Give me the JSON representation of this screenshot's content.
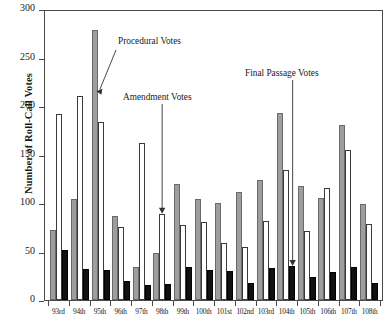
{
  "chart_data": {
    "type": "bar",
    "title": "",
    "xlabel": "",
    "ylabel": "Number of Roll-Call Votes",
    "ylim": [
      0,
      300
    ],
    "yticks": [
      0,
      50,
      100,
      150,
      200,
      250,
      300
    ],
    "grid": false,
    "legend_position": "annotations",
    "categories": [
      "93rd",
      "94th",
      "95th",
      "96th",
      "97th",
      "98th",
      "99th",
      "100th",
      "101st",
      "102nd",
      "103rd",
      "104th",
      "105th",
      "106th",
      "107th",
      "108th"
    ],
    "series": [
      {
        "name": "Procedural Votes",
        "color": "#9e9e9e",
        "values": [
          72,
          104,
          278,
          87,
          34,
          48,
          120,
          104,
          100,
          111,
          124,
          193,
          118,
          105,
          180,
          99
        ]
      },
      {
        "name": "Amendment Votes",
        "color": "#ffffff",
        "values": [
          192,
          210,
          184,
          75,
          162,
          89,
          77,
          80,
          59,
          55,
          81,
          134,
          71,
          115,
          155,
          78
        ]
      },
      {
        "name": "Final Passage Votes",
        "color": "#111111",
        "values": [
          52,
          32,
          31,
          20,
          15,
          17,
          34,
          31,
          30,
          18,
          33,
          35,
          24,
          29,
          34,
          18
        ]
      }
    ],
    "annotations": [
      {
        "text": "Procedural Votes",
        "points_to": "95th procedural bar"
      },
      {
        "text": "Amendment Votes",
        "points_to": "98th amendment bar"
      },
      {
        "text": "Final Passage Votes",
        "points_to": "104th final passage bar"
      }
    ]
  },
  "axis": {
    "y_title": "Number of Roll-Call Votes",
    "y_tick_labels": [
      "300",
      "250",
      "200",
      "150",
      "100",
      "50",
      "0"
    ]
  },
  "annotations": {
    "procedural": "Procedural Votes",
    "amendment": "Amendment Votes",
    "final_passage": "Final Passage Votes"
  }
}
